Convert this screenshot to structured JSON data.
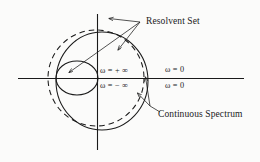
{
  "figure": {
    "type": "complex-plane-spectrum-diagram",
    "width": 260,
    "height": 162,
    "background_color": "#fbfbfa",
    "stroke_color": "#1a1a1a",
    "text_color": "#1a1a1a"
  },
  "labels": {
    "resolvent_set": "Resolvent Set",
    "continuous_spectrum": "Continuous Spectrum",
    "omega_plus_infinity": "ω = + ∞",
    "omega_minus_infinity": "ω = − ∞",
    "omega_zero_top": "ω = 0",
    "omega_zero_bottom": "ω = 0"
  },
  "axes": {
    "origin": {
      "x": 97,
      "y": 78
    },
    "horizontal": {
      "x1": 18,
      "y1": 78,
      "x2": 244,
      "y2": 78
    },
    "vertical": {
      "x1": 97,
      "y1": 14,
      "x2": 97,
      "y2": 150
    }
  },
  "shapes": {
    "dashed_circle": {
      "cx": 96,
      "cy": 78,
      "rx": 48,
      "ry": 48,
      "style": "dashed"
    },
    "large_solid_circle": {
      "cx": 102,
      "cy": 81,
      "rx": 46,
      "ry": 49,
      "style": "solid"
    },
    "small_solid_circle": {
      "cx": 77,
      "cy": 78,
      "rx": 21,
      "ry": 17,
      "style": "solid"
    }
  },
  "leaders": {
    "resolvent_junction": {
      "x": 140,
      "y": 22
    },
    "resolvent_arrows": [
      {
        "to_x": 108,
        "to_y": 18
      },
      {
        "to_x": 68,
        "to_y": 73
      },
      {
        "to_x": 118,
        "to_y": 51
      }
    ],
    "spectrum_junction": {
      "x": 150,
      "y": 106
    },
    "spectrum_arrows": [
      {
        "to_x": 145,
        "to_y": 76
      },
      {
        "to_x": 137,
        "to_y": 93
      }
    ]
  }
}
